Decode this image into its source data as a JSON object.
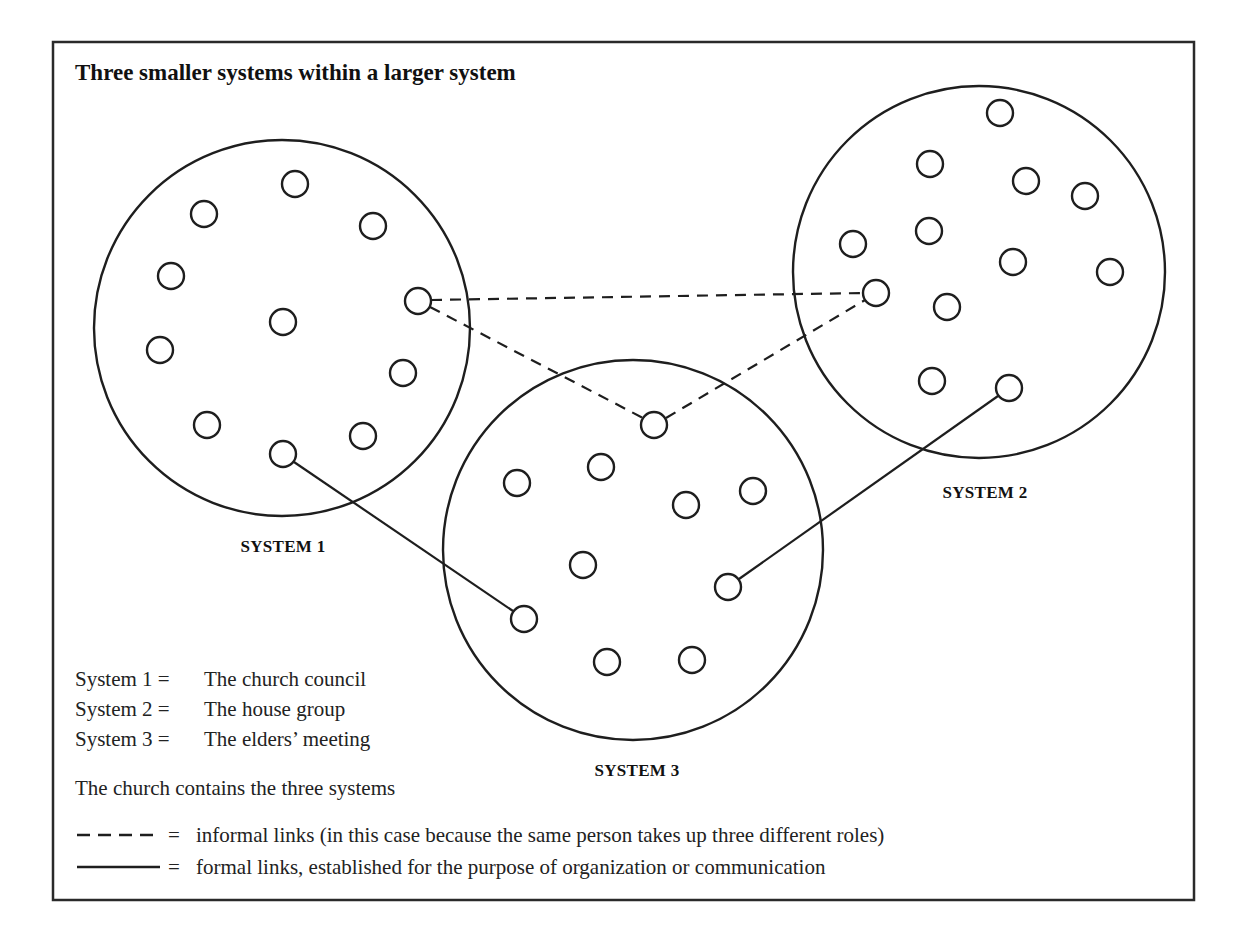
{
  "title": "Three smaller systems within a larger system",
  "systems": [
    {
      "id": "system-1",
      "label": "SYSTEM 1",
      "members": 11
    },
    {
      "id": "system-2",
      "label": "SYSTEM 2",
      "members": 12
    },
    {
      "id": "system-3",
      "label": "SYSTEM 3",
      "members": 10
    }
  ],
  "links": {
    "informal": [
      {
        "from": "system-1",
        "to": "system-2"
      },
      {
        "from": "system-1",
        "to": "system-3"
      },
      {
        "from": "system-3",
        "to": "system-2"
      }
    ],
    "formal": [
      {
        "from": "system-1",
        "to": "system-3"
      },
      {
        "from": "system-2",
        "to": "system-3"
      }
    ]
  },
  "definitions": [
    {
      "term": "System 1 =",
      "value": "The church council"
    },
    {
      "term": "System 2 =",
      "value": "The house group"
    },
    {
      "term": "System 3 =",
      "value": "The elders’ meeting"
    }
  ],
  "containment_note": "The church contains the three systems",
  "legend": {
    "informal": {
      "equals": "=",
      "text": "informal links (in this case because the same person takes up three different roles)"
    },
    "formal": {
      "equals": "=",
      "text": "formal links, established for the purpose of organization or communication"
    }
  }
}
